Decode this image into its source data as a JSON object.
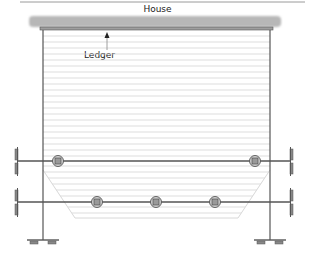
{
  "labels": {
    "house": "House",
    "ledger": "Ledger"
  },
  "colors": {
    "line": "#555555",
    "house_wall": "#bdbdbd",
    "decking": "#d6d6d6",
    "background": "#ffffff"
  },
  "structure": {
    "beams": [
      {
        "name": "upper-beam",
        "y": 161,
        "posts_x": [
          58,
          255
        ]
      },
      {
        "name": "lower-beam",
        "y": 202,
        "posts_x": [
          97,
          156,
          215
        ]
      }
    ],
    "rim_joists_x": [
      43,
      270
    ],
    "footings_x": [
      43,
      270
    ]
  }
}
